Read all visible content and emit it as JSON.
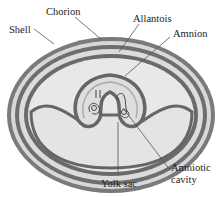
{
  "diagram": {
    "labels": {
      "shell": "Shell",
      "chorion": "Chorion",
      "allantois": "Allantois",
      "amnion": "Amnion",
      "amniotic_cavity_1": "Amniotic",
      "amniotic_cavity_2": "cavity",
      "yolk_sac": "Yolk sac"
    },
    "colors": {
      "membrane_dark": "#6b6b6b",
      "membrane_light": "#b5b5b5",
      "fill": "#e6e6e6",
      "background": "#ffffff",
      "leader": "#555555"
    }
  }
}
